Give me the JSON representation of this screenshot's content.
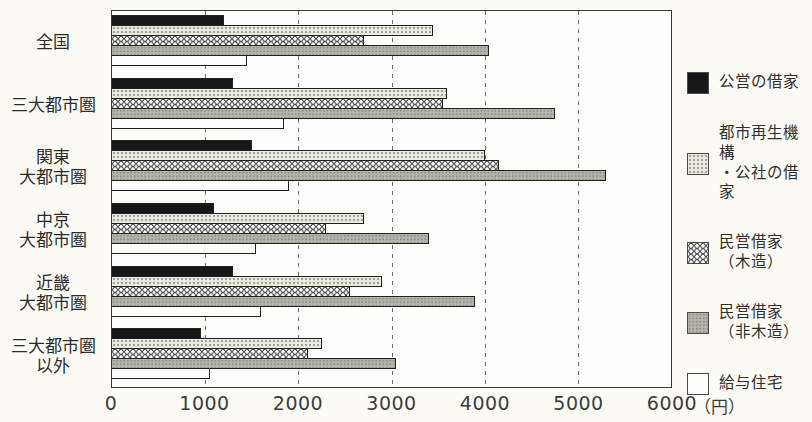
{
  "chart_data": {
    "type": "bar",
    "orientation": "horizontal",
    "title": "",
    "xlabel": "",
    "ylabel": "",
    "unit_label": "（円）",
    "xlim": [
      0,
      6000
    ],
    "x_ticks": [
      0,
      1000,
      2000,
      3000,
      4000,
      5000,
      6000
    ],
    "grid": "dashed-vertical",
    "legend_position": "right",
    "categories": [
      "全国",
      "三大都市圏",
      "関東\n大都市圏",
      "中京\n大都市圏",
      "近畿\n大都市圏",
      "三大都市圏\n以外"
    ],
    "series": [
      {
        "name": "公営の借家",
        "pattern": "p-black",
        "values": [
          1200,
          1300,
          1500,
          1100,
          1300,
          950
        ]
      },
      {
        "name": "都市再生機構\n・公社の借家",
        "pattern": "p-finedot",
        "values": [
          3450,
          3600,
          4000,
          2700,
          2900,
          2250
        ]
      },
      {
        "name": "民営借家\n（木造）",
        "pattern": "p-ring",
        "values": [
          2700,
          3550,
          4150,
          2300,
          2550,
          2100
        ]
      },
      {
        "name": "民営借家\n（非木造）",
        "pattern": "p-gray",
        "values": [
          4050,
          4750,
          5300,
          3400,
          3900,
          3050
        ]
      },
      {
        "name": "給与住宅",
        "pattern": "p-white",
        "values": [
          1450,
          1850,
          1900,
          1550,
          1600,
          1050
        ]
      }
    ]
  },
  "colors": {
    "background": "#fcfbf6",
    "bar_black": "#171717",
    "bar_light_dotted": "#eaeae1",
    "bar_gray": "#b4b4ab",
    "bar_white": "#fdfdfb",
    "border": "#3a3a3a",
    "gridline": "#6e6e6e",
    "text": "#2e2e2e"
  }
}
